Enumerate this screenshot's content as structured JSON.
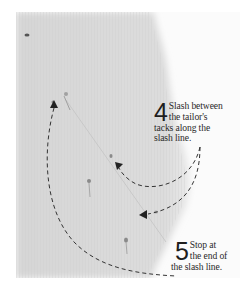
{
  "figure": {
    "colors": {
      "fabric": "#d8d8d8",
      "background": "#ffffff",
      "text": "#2a2a2a",
      "arrow": "#333333"
    }
  },
  "steps": [
    {
      "number": "4",
      "lines": [
        "Slash between",
        "the tailor's",
        "tacks along the",
        "slash line."
      ]
    },
    {
      "number": "5",
      "lines": [
        "Stop at",
        "the end of",
        "the slash line."
      ]
    }
  ],
  "icons": {
    "arrowhead": "arrowhead-icon",
    "tack": "tailor-tack-icon"
  }
}
